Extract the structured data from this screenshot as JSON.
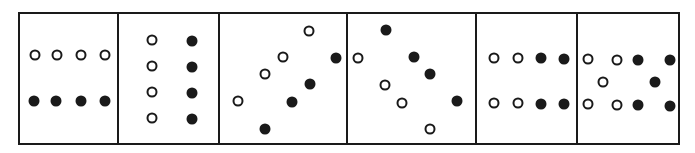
{
  "figure": {
    "panel_count": 6,
    "colors": {
      "line": "#1a1a1a",
      "open_fill": "#ffffff",
      "filled": "#1a1a1a"
    },
    "panels": [
      {
        "id": 1,
        "x0": 18,
        "x1": 119,
        "dots": [
          {
            "x": 35,
            "y": 55,
            "t": "open"
          },
          {
            "x": 57,
            "y": 55,
            "t": "open"
          },
          {
            "x": 81,
            "y": 55,
            "t": "open"
          },
          {
            "x": 105,
            "y": 55,
            "t": "open"
          },
          {
            "x": 34,
            "y": 101,
            "t": "filled"
          },
          {
            "x": 56,
            "y": 101,
            "t": "filled"
          },
          {
            "x": 81,
            "y": 101,
            "t": "filled"
          },
          {
            "x": 105,
            "y": 101,
            "t": "filled"
          }
        ]
      },
      {
        "id": 2,
        "x0": 119,
        "x1": 220,
        "dots": [
          {
            "x": 152,
            "y": 40,
            "t": "open"
          },
          {
            "x": 152,
            "y": 66,
            "t": "open"
          },
          {
            "x": 152,
            "y": 92,
            "t": "open"
          },
          {
            "x": 152,
            "y": 118,
            "t": "open"
          },
          {
            "x": 192,
            "y": 41,
            "t": "filled"
          },
          {
            "x": 192,
            "y": 67,
            "t": "filled"
          },
          {
            "x": 192,
            "y": 93,
            "t": "filled"
          },
          {
            "x": 192,
            "y": 119,
            "t": "filled"
          }
        ]
      },
      {
        "id": 3,
        "x0": 220,
        "x1": 348,
        "dots": [
          {
            "x": 309,
            "y": 31,
            "t": "open"
          },
          {
            "x": 283,
            "y": 57,
            "t": "open"
          },
          {
            "x": 265,
            "y": 74,
            "t": "open"
          },
          {
            "x": 238,
            "y": 101,
            "t": "open"
          },
          {
            "x": 336,
            "y": 58,
            "t": "filled"
          },
          {
            "x": 310,
            "y": 84,
            "t": "filled"
          },
          {
            "x": 292,
            "y": 102,
            "t": "filled"
          },
          {
            "x": 265,
            "y": 129,
            "t": "filled"
          }
        ]
      },
      {
        "id": 4,
        "x0": 348,
        "x1": 477,
        "dots": [
          {
            "x": 358,
            "y": 58,
            "t": "open"
          },
          {
            "x": 385,
            "y": 85,
            "t": "open"
          },
          {
            "x": 402,
            "y": 103,
            "t": "open"
          },
          {
            "x": 430,
            "y": 129,
            "t": "open"
          },
          {
            "x": 386,
            "y": 30,
            "t": "filled"
          },
          {
            "x": 414,
            "y": 57,
            "t": "filled"
          },
          {
            "x": 430,
            "y": 74,
            "t": "filled"
          },
          {
            "x": 457,
            "y": 101,
            "t": "filled"
          }
        ]
      },
      {
        "id": 5,
        "x0": 477,
        "x1": 578,
        "dots": [
          {
            "x": 494,
            "y": 58,
            "t": "open"
          },
          {
            "x": 518,
            "y": 58,
            "t": "open"
          },
          {
            "x": 494,
            "y": 103,
            "t": "open"
          },
          {
            "x": 518,
            "y": 103,
            "t": "open"
          },
          {
            "x": 541,
            "y": 58,
            "t": "filled"
          },
          {
            "x": 564,
            "y": 59,
            "t": "filled"
          },
          {
            "x": 541,
            "y": 104,
            "t": "filled"
          },
          {
            "x": 564,
            "y": 104,
            "t": "filled"
          }
        ]
      },
      {
        "id": 6,
        "x0": 578,
        "x1": 680,
        "dots": [
          {
            "x": 588,
            "y": 59,
            "t": "open"
          },
          {
            "x": 617,
            "y": 60,
            "t": "open"
          },
          {
            "x": 603,
            "y": 82,
            "t": "open"
          },
          {
            "x": 588,
            "y": 104,
            "t": "open"
          },
          {
            "x": 617,
            "y": 105,
            "t": "open"
          },
          {
            "x": 638,
            "y": 60,
            "t": "filled"
          },
          {
            "x": 670,
            "y": 60,
            "t": "filled"
          },
          {
            "x": 655,
            "y": 82,
            "t": "filled"
          },
          {
            "x": 638,
            "y": 105,
            "t": "filled"
          },
          {
            "x": 670,
            "y": 106,
            "t": "filled"
          }
        ]
      }
    ]
  }
}
